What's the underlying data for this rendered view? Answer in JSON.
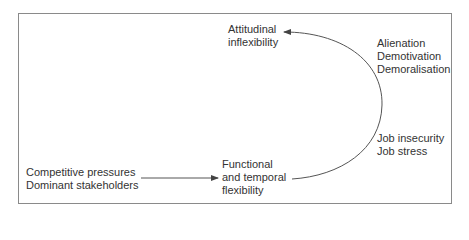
{
  "diagram": {
    "nodes": {
      "attitudinal": {
        "lines": [
          "Attitudinal",
          "inflexibility"
        ]
      },
      "alienation": {
        "lines": [
          "Alienation",
          "Demotivation",
          "Demoralisation"
        ]
      },
      "job": {
        "lines": [
          "Job insecurity",
          "Job stress"
        ]
      },
      "functional": {
        "lines": [
          "Functional",
          "and temporal",
          "flexibility"
        ]
      },
      "pressures": {
        "lines": [
          "Competitive pressures",
          "Dominant stakeholders"
        ]
      }
    },
    "edges": [
      {
        "from": "pressures",
        "to": "functional",
        "style": "straight-arrow"
      },
      {
        "from": "functional",
        "to": "attitudinal",
        "style": "curved-arrow",
        "annotations": [
          "job",
          "alienation"
        ]
      }
    ],
    "colors": {
      "line": "#555555",
      "text": "#333333",
      "border": "#8a8a8a"
    }
  }
}
